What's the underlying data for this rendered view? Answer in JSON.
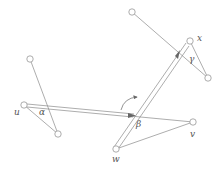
{
  "diagram": {
    "nodes": [
      {
        "id": "a_top"
      },
      {
        "id": "u",
        "label": "u"
      },
      {
        "id": "a_bot"
      },
      {
        "id": "g_top"
      },
      {
        "id": "x",
        "label": "x"
      },
      {
        "id": "g_right"
      },
      {
        "id": "w",
        "label": "w"
      },
      {
        "id": "v",
        "label": "v"
      }
    ],
    "edges": [
      {
        "from": "a_top",
        "to": "a_bot"
      },
      {
        "from": "u",
        "to": "a_bot"
      },
      {
        "from": "g_top",
        "to": "g_right"
      },
      {
        "from": "x",
        "to": "g_right"
      },
      {
        "from": "w",
        "to": "v"
      },
      {
        "from": "v",
        "to": "u"
      }
    ],
    "double_edges": [
      {
        "from": "u",
        "to": "beta_crossing",
        "arrow": true
      },
      {
        "from": "w",
        "to": "x",
        "arrow": true
      }
    ],
    "angle_labels": {
      "alpha": "α",
      "beta": "β",
      "gamma": "γ"
    },
    "node_labels": {
      "u": "u",
      "v": "v",
      "w": "w",
      "x": "x"
    }
  }
}
